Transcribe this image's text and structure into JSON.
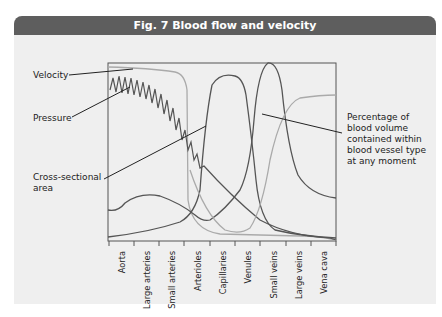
{
  "figure": {
    "title": "Fig. 7  Blood flow and velocity"
  },
  "labels": {
    "velocity": "Velocity",
    "pressure": "Pressure",
    "cross_section_1": "Cross-sectional",
    "cross_section_2": "area",
    "percentage_1": "Percentage of",
    "percentage_2": "blood volume",
    "percentage_3": "contained within",
    "percentage_4": "blood vessel type",
    "percentage_5": "at any moment"
  },
  "x_axis": {
    "ticks": [
      "Aorta",
      "Large arteries",
      "Small arteries",
      "Arterioles",
      "Capillaries",
      "Venules",
      "Small veins",
      "Large veins",
      "Vena cava"
    ]
  },
  "colors": {
    "header_bg": "#5e5e5e",
    "panel_bg": "#efefef",
    "curve_dark": "#555555",
    "curve_light": "#aaaaaa"
  }
}
